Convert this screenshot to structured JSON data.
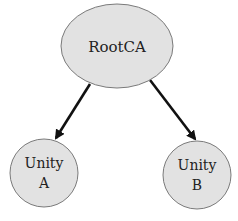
{
  "diagram": {
    "type": "tree",
    "colors": {
      "node_fill": "#e2e2e2",
      "node_stroke": "#7a7a7a",
      "edge": "#111111",
      "text": "#222222"
    },
    "nodes": [
      {
        "id": "root",
        "label": "RootCA",
        "lines": [
          "RootCA"
        ]
      },
      {
        "id": "unity_a",
        "label": "Unity A",
        "lines": [
          "Unity",
          "A"
        ]
      },
      {
        "id": "unity_b",
        "label": "Unity B",
        "lines": [
          "Unity",
          "B"
        ]
      }
    ],
    "edges": [
      {
        "from": "root",
        "to": "unity_a"
      },
      {
        "from": "root",
        "to": "unity_b"
      }
    ]
  }
}
